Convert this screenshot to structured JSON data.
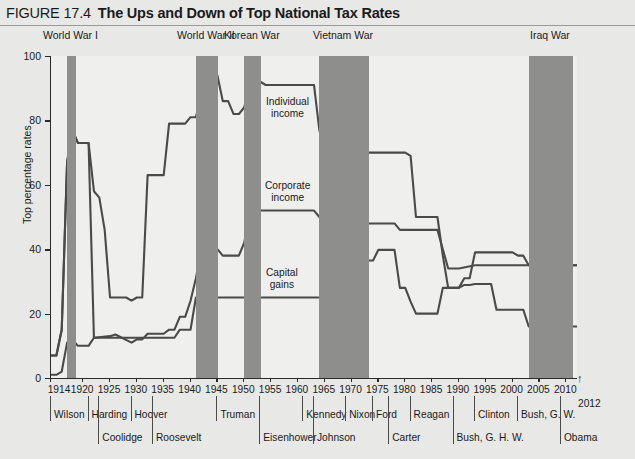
{
  "figure": {
    "number": "FIGURE 17.4",
    "title": "The Ups and Down of Top National Tax Rates"
  },
  "chart_data": {
    "type": "line",
    "title": "The Ups and Down of Top National Tax Rates",
    "xlabel": "",
    "ylabel": "Top percentage rates",
    "xlim": [
      1914,
      2012
    ],
    "ylim": [
      0,
      100
    ],
    "grid": false,
    "legend_position": "inline-annotations",
    "y_ticks": [
      0,
      20,
      40,
      60,
      80,
      100
    ],
    "x_ticks": [
      1914,
      1920,
      1925,
      1930,
      1935,
      1940,
      1945,
      1950,
      1955,
      1960,
      1965,
      1970,
      1975,
      1980,
      1985,
      1990,
      1995,
      2000,
      2005,
      2010
    ],
    "x_end_note": "2012",
    "series": [
      {
        "name": "Individual income",
        "points": [
          [
            1914,
            7
          ],
          [
            1915,
            7
          ],
          [
            1916,
            15
          ],
          [
            1917,
            67
          ],
          [
            1918,
            77
          ],
          [
            1919,
            73
          ],
          [
            1920,
            73
          ],
          [
            1921,
            73
          ],
          [
            1922,
            58
          ],
          [
            1923,
            56
          ],
          [
            1924,
            46
          ],
          [
            1925,
            25
          ],
          [
            1926,
            25
          ],
          [
            1927,
            25
          ],
          [
            1928,
            25
          ],
          [
            1929,
            24
          ],
          [
            1930,
            25
          ],
          [
            1931,
            25
          ],
          [
            1932,
            63
          ],
          [
            1933,
            63
          ],
          [
            1934,
            63
          ],
          [
            1935,
            63
          ],
          [
            1936,
            79
          ],
          [
            1937,
            79
          ],
          [
            1938,
            79
          ],
          [
            1939,
            79
          ],
          [
            1940,
            81
          ],
          [
            1941,
            81
          ],
          [
            1942,
            88
          ],
          [
            1943,
            88
          ],
          [
            1944,
            94
          ],
          [
            1945,
            94
          ],
          [
            1946,
            86
          ],
          [
            1947,
            86
          ],
          [
            1948,
            82
          ],
          [
            1949,
            82
          ],
          [
            1950,
            84
          ],
          [
            1951,
            91
          ],
          [
            1952,
            92
          ],
          [
            1953,
            92
          ],
          [
            1954,
            91
          ],
          [
            1955,
            91
          ],
          [
            1960,
            91
          ],
          [
            1963,
            91
          ],
          [
            1964,
            77
          ],
          [
            1965,
            70
          ],
          [
            1966,
            70
          ],
          [
            1967,
            70
          ],
          [
            1968,
            75
          ],
          [
            1969,
            77
          ],
          [
            1970,
            71
          ],
          [
            1971,
            70
          ],
          [
            1972,
            70
          ],
          [
            1975,
            70
          ],
          [
            1980,
            70
          ],
          [
            1981,
            69
          ],
          [
            1982,
            50
          ],
          [
            1983,
            50
          ],
          [
            1985,
            50
          ],
          [
            1986,
            50
          ],
          [
            1987,
            38
          ],
          [
            1988,
            28
          ],
          [
            1989,
            28
          ],
          [
            1990,
            28
          ],
          [
            1991,
            31
          ],
          [
            1992,
            31
          ],
          [
            1993,
            39
          ],
          [
            1994,
            39
          ],
          [
            1999,
            39
          ],
          [
            2000,
            39
          ],
          [
            2001,
            38
          ],
          [
            2002,
            38
          ],
          [
            2003,
            35
          ],
          [
            2004,
            35
          ],
          [
            2010,
            35
          ],
          [
            2012,
            35
          ]
        ]
      },
      {
        "name": "Corporate income",
        "points": [
          [
            1914,
            1
          ],
          [
            1915,
            1
          ],
          [
            1916,
            2
          ],
          [
            1917,
            11
          ],
          [
            1918,
            12
          ],
          [
            1919,
            10
          ],
          [
            1920,
            10
          ],
          [
            1921,
            10
          ],
          [
            1922,
            12.5
          ],
          [
            1925,
            13
          ],
          [
            1926,
            13.5
          ],
          [
            1929,
            11
          ],
          [
            1930,
            12
          ],
          [
            1931,
            12
          ],
          [
            1932,
            13.75
          ],
          [
            1933,
            13.75
          ],
          [
            1934,
            13.75
          ],
          [
            1935,
            13.75
          ],
          [
            1936,
            15
          ],
          [
            1937,
            15
          ],
          [
            1938,
            19
          ],
          [
            1939,
            19
          ],
          [
            1940,
            24
          ],
          [
            1941,
            31
          ],
          [
            1942,
            40
          ],
          [
            1943,
            40
          ],
          [
            1944,
            40
          ],
          [
            1945,
            40
          ],
          [
            1946,
            38
          ],
          [
            1947,
            38
          ],
          [
            1948,
            38
          ],
          [
            1949,
            38
          ],
          [
            1950,
            42
          ],
          [
            1951,
            50.75
          ],
          [
            1952,
            52
          ],
          [
            1953,
            52
          ],
          [
            1954,
            52
          ],
          [
            1960,
            52
          ],
          [
            1963,
            52
          ],
          [
            1964,
            50
          ],
          [
            1965,
            48
          ],
          [
            1966,
            48
          ],
          [
            1967,
            48
          ],
          [
            1968,
            52.8
          ],
          [
            1969,
            52.8
          ],
          [
            1970,
            49.2
          ],
          [
            1971,
            48
          ],
          [
            1975,
            48
          ],
          [
            1978,
            48
          ],
          [
            1979,
            46
          ],
          [
            1980,
            46
          ],
          [
            1985,
            46
          ],
          [
            1986,
            46
          ],
          [
            1987,
            40
          ],
          [
            1988,
            34
          ],
          [
            1989,
            34
          ],
          [
            1990,
            34
          ],
          [
            1993,
            35
          ],
          [
            1994,
            35
          ],
          [
            2000,
            35
          ],
          [
            2005,
            35
          ],
          [
            2010,
            35
          ],
          [
            2012,
            35
          ]
        ]
      },
      {
        "name": "Capital gains",
        "points": [
          [
            1914,
            7
          ],
          [
            1915,
            7
          ],
          [
            1916,
            15
          ],
          [
            1917,
            67
          ],
          [
            1918,
            77
          ],
          [
            1919,
            73
          ],
          [
            1920,
            73
          ],
          [
            1921,
            73
          ],
          [
            1922,
            12.5
          ],
          [
            1925,
            12.5
          ],
          [
            1929,
            12.5
          ],
          [
            1930,
            12.5
          ],
          [
            1935,
            12.5
          ],
          [
            1937,
            12.5
          ],
          [
            1938,
            15
          ],
          [
            1939,
            15
          ],
          [
            1940,
            15
          ],
          [
            1941,
            25
          ],
          [
            1942,
            25
          ],
          [
            1945,
            25
          ],
          [
            1950,
            25
          ],
          [
            1955,
            25
          ],
          [
            1960,
            25
          ],
          [
            1963,
            25
          ],
          [
            1964,
            25
          ],
          [
            1967,
            25
          ],
          [
            1968,
            26.9
          ],
          [
            1969,
            27.5
          ],
          [
            1970,
            32.2
          ],
          [
            1971,
            34.2
          ],
          [
            1972,
            36.5
          ],
          [
            1973,
            36.5
          ],
          [
            1974,
            36.5
          ],
          [
            1975,
            39.8
          ],
          [
            1976,
            39.8
          ],
          [
            1977,
            39.8
          ],
          [
            1978,
            39.8
          ],
          [
            1979,
            28
          ],
          [
            1980,
            28
          ],
          [
            1981,
            23.7
          ],
          [
            1982,
            20
          ],
          [
            1983,
            20
          ],
          [
            1985,
            20
          ],
          [
            1986,
            20
          ],
          [
            1987,
            28
          ],
          [
            1988,
            28
          ],
          [
            1989,
            28
          ],
          [
            1990,
            28
          ],
          [
            1991,
            28.9
          ],
          [
            1992,
            28.9
          ],
          [
            1993,
            29.2
          ],
          [
            1994,
            29.2
          ],
          [
            1995,
            29.2
          ],
          [
            1996,
            29.2
          ],
          [
            1997,
            21.2
          ],
          [
            1998,
            21.2
          ],
          [
            2000,
            21.2
          ],
          [
            2001,
            21.2
          ],
          [
            2002,
            21.2
          ],
          [
            2003,
            16
          ],
          [
            2004,
            16
          ],
          [
            2010,
            16
          ],
          [
            2012,
            16
          ]
        ]
      }
    ],
    "war_bands": [
      {
        "label": "World War I",
        "start": 1917,
        "end": 1918.6
      },
      {
        "label": "World War II",
        "start": 1941,
        "end": 1945.2
      },
      {
        "label": "Korean War",
        "start": 1950,
        "end": 1953.2
      },
      {
        "label": "Vietnam War",
        "start": 1964,
        "end": 1973.2
      },
      {
        "label": "Iraq War",
        "start": 2003,
        "end": 2011.3
      }
    ],
    "annotations": [
      {
        "text": "Individual income",
        "year": 1958,
        "value": 84
      },
      {
        "text": "Corporate income",
        "year": 1958,
        "value": 58
      },
      {
        "text": "Capital gains",
        "year": 1957,
        "value": 31
      }
    ],
    "presidents_row_1": [
      {
        "name": "Wilson",
        "year": 1914
      },
      {
        "name": "Harding",
        "year": 1921
      },
      {
        "name": "Hoover",
        "year": 1929
      },
      {
        "name": "Truman",
        "year": 1945
      },
      {
        "name": "Kennedy",
        "year": 1961
      },
      {
        "name": "Nixon",
        "year": 1969
      },
      {
        "name": "Ford",
        "year": 1974
      },
      {
        "name": "Reagan",
        "year": 1981
      },
      {
        "name": "Clinton",
        "year": 1993
      },
      {
        "name": "Bush, G. W.",
        "year": 2001
      }
    ],
    "presidents_row_2": [
      {
        "name": "Coolidge",
        "year": 1923
      },
      {
        "name": "Roosevelt",
        "year": 1933
      },
      {
        "name": "Eisenhower",
        "year": 1953
      },
      {
        "name": "Johnson",
        "year": 1963
      },
      {
        "name": "Carter",
        "year": 1977
      },
      {
        "name": "Bush, G. H. W.",
        "year": 1989
      },
      {
        "name": "Obama",
        "year": 2009
      }
    ]
  },
  "colors": {
    "line": "#4a4a4a",
    "war_band": "#8e8e8c",
    "plot_bg": "#efefed",
    "page_bg": "#e8e8e6",
    "axis": "#2b2b2b"
  }
}
